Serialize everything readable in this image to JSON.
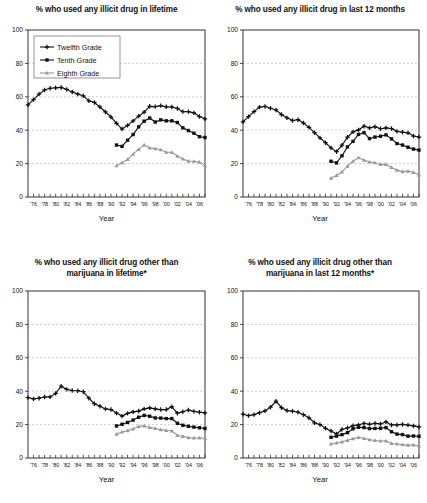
{
  "page": {
    "width": 427,
    "height": 503,
    "background": "#ffffff"
  },
  "legend": {
    "position": "top-left-inside-panel-1",
    "entries": [
      {
        "label": "Twelfth Grade",
        "marker": "plus-cross",
        "color": "#111111"
      },
      {
        "label": "Tenth Grade",
        "marker": "filled-square",
        "color": "#111111"
      },
      {
        "label": "Eighth Grade",
        "marker": "triangle",
        "color": "#9a9a9a"
      }
    ]
  },
  "axis": {
    "xlabel": "Year",
    "yticks": [
      0,
      20,
      40,
      60,
      80,
      100
    ],
    "xticks": [
      "'76",
      "'78",
      "'80",
      "'82",
      "'84",
      "'86",
      "'88",
      "'90",
      "'92",
      "'94",
      "'96",
      "'98",
      "'00",
      "'02",
      "'04",
      "'06"
    ]
  },
  "colors": {
    "twelfth": "#111111",
    "tenth": "#111111",
    "eighth": "#9a9a9a",
    "grid": "#b9b9b9",
    "frame": "#333333"
  },
  "chart_data": [
    {
      "id": "illicit-lifetime",
      "type": "line",
      "title": "% who used any illicit drug in lifetime",
      "title_line2": "",
      "xlabel": "Year",
      "ylabel": "",
      "ylim": [
        0,
        100
      ],
      "xlim": [
        1975,
        2007
      ],
      "grid": true,
      "legend": "inside top-left",
      "x": [
        1975,
        1976,
        1977,
        1978,
        1979,
        1980,
        1981,
        1982,
        1983,
        1984,
        1985,
        1986,
        1987,
        1988,
        1989,
        1990,
        1991,
        1992,
        1993,
        1994,
        1995,
        1996,
        1997,
        1998,
        1999,
        2000,
        2001,
        2002,
        2003,
        2004,
        2005,
        2006,
        2007
      ],
      "series": [
        {
          "name": "Twelfth Grade",
          "marker": "plus-cross",
          "color": "#111111",
          "x": [
            1975,
            1976,
            1977,
            1978,
            1979,
            1980,
            1981,
            1982,
            1983,
            1984,
            1985,
            1986,
            1987,
            1988,
            1989,
            1990,
            1991,
            1992,
            1993,
            1994,
            1995,
            1996,
            1997,
            1998,
            1999,
            2000,
            2001,
            2002,
            2003,
            2004,
            2005,
            2006,
            2007
          ],
          "values": [
            55.2,
            58.3,
            61.6,
            64.1,
            65.1,
            65.4,
            65.6,
            64.4,
            62.9,
            61.6,
            60.6,
            57.6,
            56.6,
            53.9,
            50.9,
            47.9,
            44.1,
            40.7,
            42.9,
            45.6,
            48.4,
            50.8,
            54.3,
            54.1,
            54.7,
            54.0,
            53.9,
            53.0,
            51.1,
            51.1,
            50.4,
            48.2,
            46.8
          ]
        },
        {
          "name": "Tenth Grade",
          "marker": "filled-square",
          "color": "#111111",
          "x": [
            1991,
            1992,
            1993,
            1994,
            1995,
            1996,
            1997,
            1998,
            1999,
            2000,
            2001,
            2002,
            2003,
            2004,
            2005,
            2006,
            2007
          ],
          "values": [
            31.1,
            30.3,
            34.0,
            37.4,
            42.0,
            45.4,
            47.3,
            44.9,
            46.2,
            45.6,
            45.6,
            44.6,
            41.4,
            39.8,
            38.2,
            36.1,
            35.6
          ]
        },
        {
          "name": "Eighth Grade",
          "marker": "triangle",
          "color": "#9a9a9a",
          "x": [
            1991,
            1992,
            1993,
            1994,
            1995,
            1996,
            1997,
            1998,
            1999,
            2000,
            2001,
            2002,
            2003,
            2004,
            2005,
            2006,
            2007
          ],
          "values": [
            18.7,
            20.6,
            22.5,
            25.7,
            28.5,
            31.2,
            29.4,
            29.0,
            28.3,
            26.8,
            26.8,
            24.5,
            22.8,
            21.5,
            21.4,
            20.9,
            19.0
          ]
        }
      ]
    },
    {
      "id": "illicit-12months",
      "type": "line",
      "title": "% who used any illicit drug in last 12 months",
      "title_line2": "",
      "xlabel": "Year",
      "ylabel": "",
      "ylim": [
        0,
        100
      ],
      "xlim": [
        1975,
        2007
      ],
      "grid": true,
      "legend": "none",
      "series": [
        {
          "name": "Twelfth Grade",
          "marker": "plus-cross",
          "color": "#111111",
          "x": [
            1975,
            1976,
            1977,
            1978,
            1979,
            1980,
            1981,
            1982,
            1983,
            1984,
            1985,
            1986,
            1987,
            1988,
            1989,
            1990,
            1991,
            1992,
            1993,
            1994,
            1995,
            1996,
            1997,
            1998,
            1999,
            2000,
            2001,
            2002,
            2003,
            2004,
            2005,
            2006,
            2007
          ],
          "values": [
            45.0,
            48.1,
            51.1,
            53.8,
            54.2,
            53.1,
            52.1,
            49.4,
            47.4,
            45.8,
            46.3,
            44.3,
            41.7,
            38.5,
            35.4,
            32.5,
            29.4,
            27.1,
            31.0,
            35.8,
            39.0,
            40.2,
            42.4,
            41.4,
            42.1,
            40.9,
            41.4,
            41.0,
            39.3,
            38.8,
            38.4,
            36.5,
            35.9
          ]
        },
        {
          "name": "Tenth Grade",
          "marker": "filled-square",
          "color": "#111111",
          "x": [
            1991,
            1992,
            1993,
            1994,
            1995,
            1996,
            1997,
            1998,
            1999,
            2000,
            2001,
            2002,
            2003,
            2004,
            2005,
            2006,
            2007
          ],
          "values": [
            21.4,
            20.4,
            24.7,
            30.0,
            33.3,
            37.5,
            38.5,
            35.0,
            35.9,
            36.4,
            37.2,
            34.8,
            32.0,
            31.1,
            29.8,
            28.7,
            28.1
          ]
        },
        {
          "name": "Eighth Grade",
          "marker": "triangle",
          "color": "#9a9a9a",
          "x": [
            1991,
            1992,
            1993,
            1994,
            1995,
            1996,
            1997,
            1998,
            1999,
            2000,
            2001,
            2002,
            2003,
            2004,
            2005,
            2006,
            2007
          ],
          "values": [
            11.3,
            12.9,
            15.1,
            18.5,
            21.4,
            23.6,
            22.1,
            21.0,
            20.5,
            19.5,
            19.5,
            17.7,
            16.1,
            15.2,
            15.5,
            14.8,
            13.2
          ]
        }
      ]
    },
    {
      "id": "other-than-marijuana-lifetime",
      "type": "line",
      "title": "% who used any illicit drug other than",
      "title_line2": "marijuana in lifetime*",
      "xlabel": "Year",
      "ylabel": "",
      "ylim": [
        0,
        100
      ],
      "xlim": [
        1975,
        2007
      ],
      "grid": true,
      "legend": "none",
      "series": [
        {
          "name": "Twelfth Grade",
          "marker": "plus-cross",
          "color": "#111111",
          "x": [
            1975,
            1976,
            1977,
            1978,
            1979,
            1980,
            1981,
            1982,
            1983,
            1984,
            1985,
            1986,
            1987,
            1988,
            1989,
            1990,
            1991,
            1992,
            1993,
            1994,
            1995,
            1996,
            1997,
            1998,
            1999,
            2000,
            2001,
            2002,
            2003,
            2004,
            2005,
            2006,
            2007
          ],
          "values": [
            36.2,
            35.4,
            35.8,
            36.5,
            36.6,
            38.7,
            43.0,
            41.1,
            40.4,
            40.3,
            39.7,
            35.8,
            32.5,
            31.0,
            29.4,
            29.0,
            26.9,
            25.1,
            26.7,
            27.6,
            28.1,
            29.4,
            30.0,
            29.4,
            29.0,
            29.0,
            30.7,
            26.8,
            27.7,
            28.7,
            27.9,
            27.4,
            27.0
          ]
        },
        {
          "name": "Tenth Grade",
          "marker": "filled-square",
          "color": "#111111",
          "x": [
            1991,
            1992,
            1993,
            1994,
            1995,
            1996,
            1997,
            1998,
            1999,
            2000,
            2001,
            2002,
            2003,
            2004,
            2005,
            2006,
            2007
          ],
          "values": [
            19.2,
            20.2,
            21.3,
            22.7,
            24.4,
            25.5,
            25.0,
            24.0,
            23.9,
            23.6,
            23.6,
            20.8,
            19.6,
            19.0,
            18.5,
            18.1,
            17.7
          ]
        },
        {
          "name": "Eighth Grade",
          "marker": "triangle",
          "color": "#9a9a9a",
          "x": [
            1991,
            1992,
            1993,
            1994,
            1995,
            1996,
            1997,
            1998,
            1999,
            2000,
            2001,
            2002,
            2003,
            2004,
            2005,
            2006,
            2007
          ],
          "values": [
            14.3,
            15.6,
            16.4,
            17.5,
            18.9,
            19.2,
            18.3,
            17.7,
            17.0,
            16.6,
            16.3,
            13.6,
            13.0,
            12.2,
            12.0,
            12.1,
            11.8
          ]
        }
      ]
    },
    {
      "id": "other-than-marijuana-12months",
      "type": "line",
      "title": "% who used any illicit drug other than",
      "title_line2": "marijuana in last 12 months*",
      "xlabel": "Year",
      "ylabel": "",
      "ylim": [
        0,
        100
      ],
      "xlim": [
        1975,
        2007
      ],
      "grid": true,
      "legend": "none",
      "series": [
        {
          "name": "Twelfth Grade",
          "marker": "plus-cross",
          "color": "#111111",
          "x": [
            1975,
            1976,
            1977,
            1978,
            1979,
            1980,
            1981,
            1982,
            1983,
            1984,
            1985,
            1986,
            1987,
            1988,
            1989,
            1990,
            1991,
            1992,
            1993,
            1994,
            1995,
            1996,
            1997,
            1998,
            1999,
            2000,
            2001,
            2002,
            2003,
            2004,
            2005,
            2006,
            2007
          ],
          "values": [
            26.2,
            25.4,
            26.0,
            27.1,
            28.2,
            30.4,
            34.0,
            30.1,
            28.4,
            28.0,
            27.4,
            25.9,
            24.1,
            21.1,
            20.0,
            17.8,
            16.2,
            14.4,
            17.1,
            18.0,
            19.4,
            19.8,
            20.7,
            20.2,
            20.7,
            20.4,
            21.6,
            19.8,
            19.8,
            20.1,
            19.7,
            19.2,
            18.6
          ]
        },
        {
          "name": "Tenth Grade",
          "marker": "filled-square",
          "color": "#111111",
          "x": [
            1991,
            1992,
            1993,
            1994,
            1995,
            1996,
            1997,
            1998,
            1999,
            2000,
            2001,
            2002,
            2003,
            2004,
            2005,
            2006,
            2007
          ],
          "values": [
            12.4,
            13.1,
            14.0,
            15.2,
            17.5,
            18.4,
            18.2,
            17.6,
            17.7,
            17.8,
            18.2,
            15.7,
            14.3,
            14.0,
            13.1,
            13.2,
            13.0
          ]
        },
        {
          "name": "Eighth Grade",
          "marker": "triangle",
          "color": "#9a9a9a",
          "x": [
            1991,
            1992,
            1993,
            1994,
            1995,
            1996,
            1997,
            1998,
            1999,
            2000,
            2001,
            2002,
            2003,
            2004,
            2005,
            2006,
            2007
          ],
          "values": [
            8.4,
            9.1,
            9.7,
            10.6,
            11.6,
            12.4,
            11.8,
            11.0,
            10.5,
            10.2,
            10.3,
            8.7,
            8.4,
            8.0,
            7.7,
            7.8,
            7.3
          ]
        }
      ]
    }
  ]
}
